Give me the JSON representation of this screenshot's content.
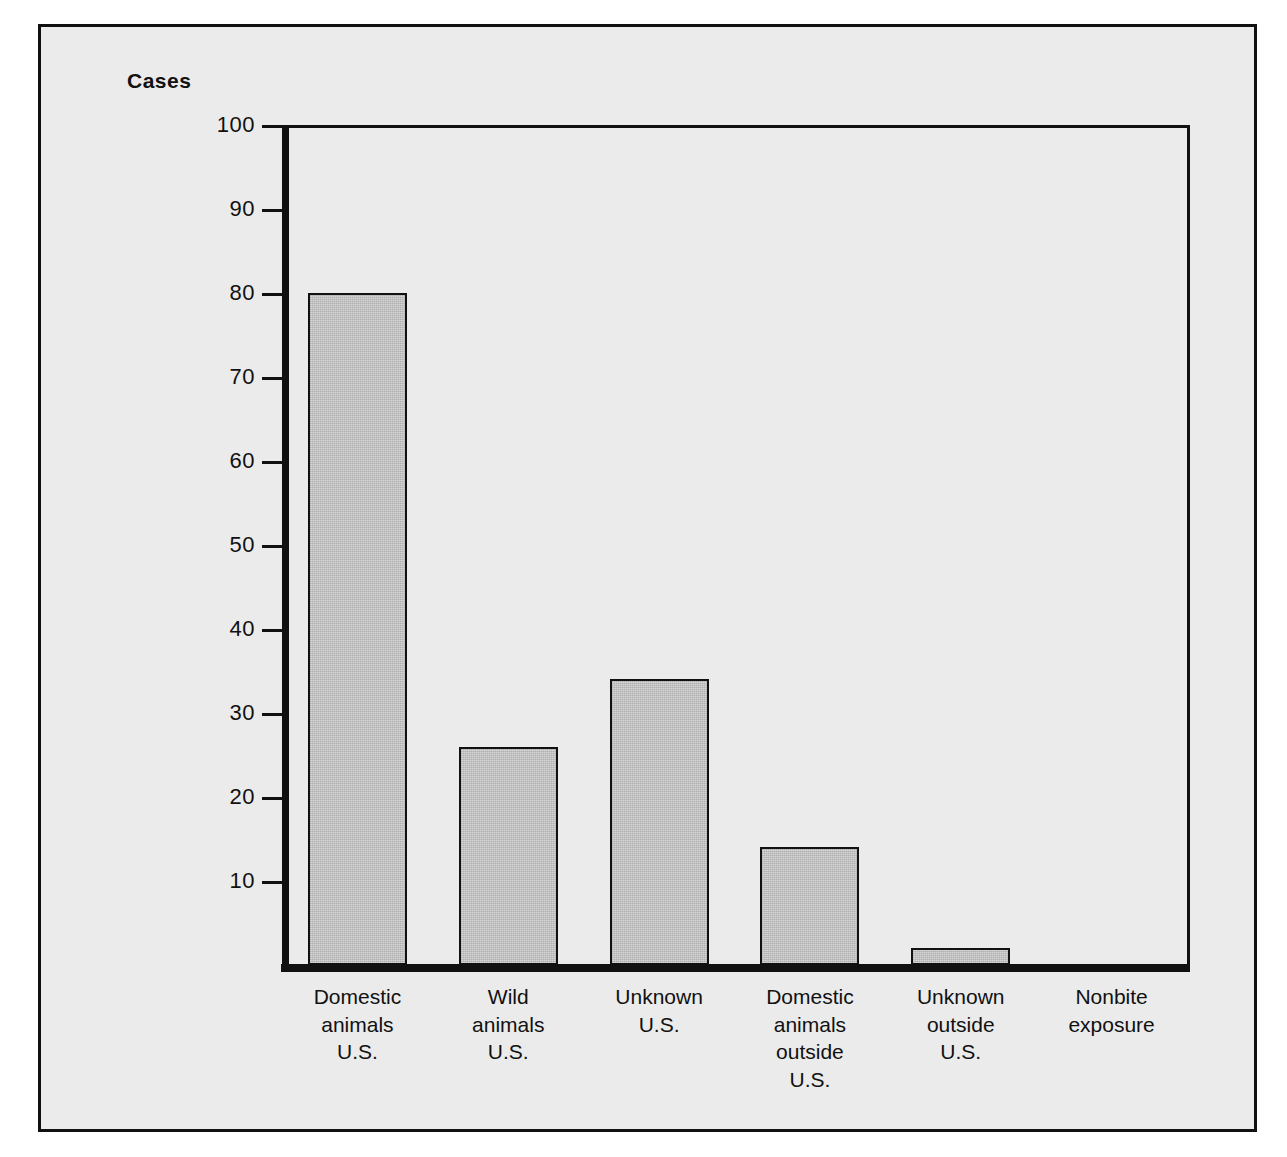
{
  "figure": {
    "axis_caption": "Cases",
    "background_color": "#ebebeb",
    "bar_fill_color": "#b9b9b9",
    "line_color": "#111111"
  },
  "chart_data": {
    "type": "bar",
    "title": "",
    "subtitle": "",
    "xlabel": "",
    "ylabel": "Cases",
    "ylim": [
      0,
      100
    ],
    "yticks": [
      0,
      10,
      20,
      30,
      40,
      50,
      60,
      70,
      80,
      90,
      100
    ],
    "ytick_labels": [
      "10",
      "20",
      "30",
      "40",
      "50",
      "60",
      "70",
      "80",
      "90",
      "100"
    ],
    "grid": false,
    "legend": false,
    "categories": [
      "Domestic\nanimals\nU.S.",
      "Wild\nanimals\nU.S.",
      "Unknown\nU.S.",
      "Domestic\nanimals\noutside\nU.S.",
      "Unknown\noutside\nU.S.",
      "Nonbite\nexposure"
    ],
    "values": [
      80,
      26,
      34,
      14,
      2,
      0
    ]
  }
}
